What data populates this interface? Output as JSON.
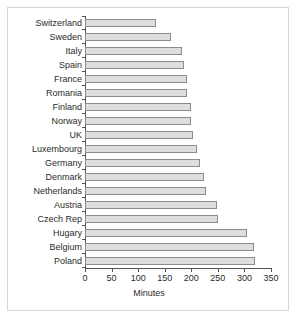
{
  "chart_data": {
    "type": "bar",
    "orientation": "horizontal",
    "title": "",
    "xlabel": "Minutes",
    "ylabel": "",
    "xlim": [
      0,
      350
    ],
    "xticks": [
      0,
      50,
      100,
      150,
      200,
      250,
      300,
      350
    ],
    "grid": false,
    "legend": false,
    "bar_color": "#dedede",
    "bar_edge_color": "#8c8c8c",
    "axis_color": "#555555",
    "border_color": "#d6d6d6",
    "text_color": "#2b2b2b",
    "categories": [
      "Switzerland",
      "Sweden",
      "Italy",
      "Spain",
      "France",
      "Romania",
      "Finland",
      "Norway",
      "UK",
      "Luxembourg",
      "Germany",
      "Denmark",
      "Netherlands",
      "Austria",
      "Czech Rep",
      "Hugary",
      "Belgium",
      "Poland"
    ],
    "values": [
      134,
      162,
      183,
      186,
      192,
      192,
      199,
      200,
      204,
      211,
      216,
      223,
      228,
      248,
      250,
      305,
      318,
      320
    ]
  }
}
